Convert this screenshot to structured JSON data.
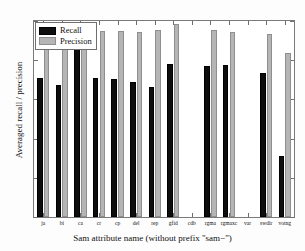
{
  "chart_data": {
    "type": "bar",
    "title": "",
    "xlabel": "Sam attribute name (without prefix \"sam−\")",
    "ylabel": "Averaged recall / precision",
    "categories": [
      "ja",
      "bi",
      "ca",
      "cr",
      "cp",
      "del",
      "rep",
      "gfid",
      "cdb",
      "rgma",
      "rgmaxc",
      "var",
      "swdir",
      "votng"
    ],
    "series": [
      {
        "name": "Recall",
        "values": [
          0.71,
          0.675,
          0.86,
          0.71,
          0.705,
          0.69,
          0.665,
          0.78,
          0,
          0.77,
          0.775,
          0,
          0.735,
          0.31
        ]
      },
      {
        "name": "Precision",
        "values": [
          0.97,
          0.97,
          0.945,
          0.95,
          0.95,
          0.945,
          0.955,
          0.985,
          0,
          0.955,
          0.945,
          0,
          0.935,
          0.835
        ]
      }
    ],
    "ylim": [
      0,
      1
    ],
    "yticks": [
      0,
      0.2,
      0.4,
      0.6,
      0.8,
      1
    ],
    "ytick_labels": [
      "0",
      "0.2",
      "0.4",
      "0.6",
      "0.8",
      "1"
    ],
    "grid": false,
    "legend_position": "top-left",
    "colors": {
      "recall": "#0d0d0d",
      "precision": "#b5b5b5",
      "axis": "#7a7a7a",
      "background": "#ffffff"
    }
  },
  "legend": {
    "entries": [
      {
        "label": "Recall"
      },
      {
        "label": "Precision"
      }
    ]
  }
}
